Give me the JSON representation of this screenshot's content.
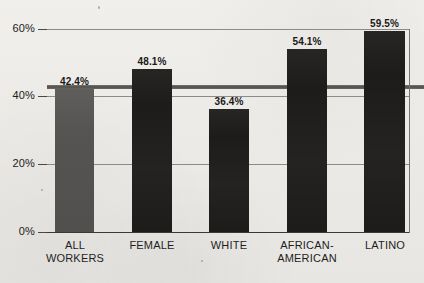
{
  "chart_data": {
    "type": "bar",
    "title": "",
    "xlabel": "",
    "ylabel": "",
    "categories": [
      "ALL\nWORKERS",
      "FEMALE",
      "WHITE",
      "AFRICAN-\nAMERICAN",
      "LATINO"
    ],
    "values": [
      42.4,
      48.1,
      36.4,
      54.1,
      59.5
    ],
    "value_labels": [
      "42.4%",
      "48.1%",
      "36.4%",
      "54.1%",
      "59.5%"
    ],
    "ylim": [
      0,
      60
    ],
    "yticks": [
      0,
      20,
      40,
      60
    ],
    "ytick_labels": [
      "0%",
      "20%",
      "40%",
      "60%"
    ],
    "grid": true,
    "legend": "none",
    "bar_colors": [
      "#565452",
      "#1d1c1b",
      "#1d1c1b",
      "#1d1c1b",
      "#1d1c1b"
    ],
    "series": [
      {
        "name": "",
        "values": [
          42.4,
          48.1,
          36.4,
          54.1,
          59.5
        ]
      }
    ]
  },
  "axis": {
    "y_tick_60": "60%",
    "y_tick_40": "40%",
    "y_tick_20": "20%",
    "y_tick_0": "0%"
  },
  "bars": [
    {
      "category_line1": "ALL",
      "category_line2": "WORKERS",
      "value_label": "42.4%"
    },
    {
      "category_line1": "FEMALE",
      "category_line2": "",
      "value_label": "48.1%"
    },
    {
      "category_line1": "WHITE",
      "category_line2": "",
      "value_label": "36.4%"
    },
    {
      "category_line1": "AFRICAN-",
      "category_line2": "AMERICAN",
      "value_label": "54.1%"
    },
    {
      "category_line1": "LATINO",
      "category_line2": "",
      "value_label": "59.5%"
    }
  ],
  "colors": {
    "paper": "#edebe7",
    "bar_dark": "#1d1c1b",
    "bar_light": "#565452",
    "gridline": "#8d8b88",
    "text": "#1f1e1d"
  }
}
